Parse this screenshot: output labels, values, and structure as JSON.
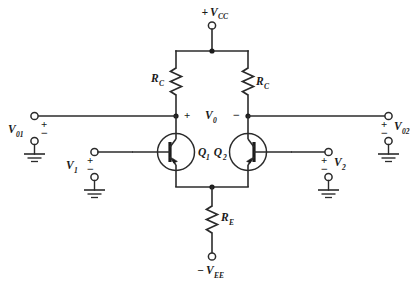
{
  "diagram": {
    "type": "schematic",
    "background_color": "#ffffff",
    "line_color": "#2b2b2b"
  },
  "supplies": {
    "positive": {
      "sign": "+",
      "label": "V",
      "subscript": "CC",
      "terminal": "open-circle"
    },
    "negative": {
      "sign": "−",
      "label": "V",
      "subscript": "EE",
      "terminal": "open-circle"
    }
  },
  "resistors": [
    {
      "name": "collector-resistor-left",
      "label": "R",
      "subscript": "C"
    },
    {
      "name": "collector-resistor-right",
      "label": "R",
      "subscript": "C"
    },
    {
      "name": "emitter-resistor",
      "label": "R",
      "subscript": "E"
    }
  ],
  "transistors": [
    {
      "name": "transistor-q1",
      "label": "Q",
      "subscript": "1",
      "kind": "npn"
    },
    {
      "name": "transistor-q2",
      "label": "Q",
      "subscript": "2",
      "kind": "npn"
    }
  ],
  "output_differential": {
    "label": "V",
    "subscript": "0",
    "plus_sign": "+",
    "minus_sign": "−"
  },
  "ports": {
    "output_left": {
      "label": "V",
      "subscript": "01",
      "plus_sign": "+",
      "minus_sign": "−",
      "ground": "earth-ground"
    },
    "output_right": {
      "label": "V",
      "subscript": "02",
      "plus_sign": "+",
      "minus_sign": "−",
      "ground": "earth-ground"
    },
    "input_left": {
      "label": "V",
      "subscript": "1",
      "plus_sign": "+",
      "minus_sign": "−",
      "ground": "earth-ground"
    },
    "input_right": {
      "label": "V",
      "subscript": "2",
      "plus_sign": "+",
      "minus_sign": "−",
      "ground": "earth-ground"
    }
  }
}
